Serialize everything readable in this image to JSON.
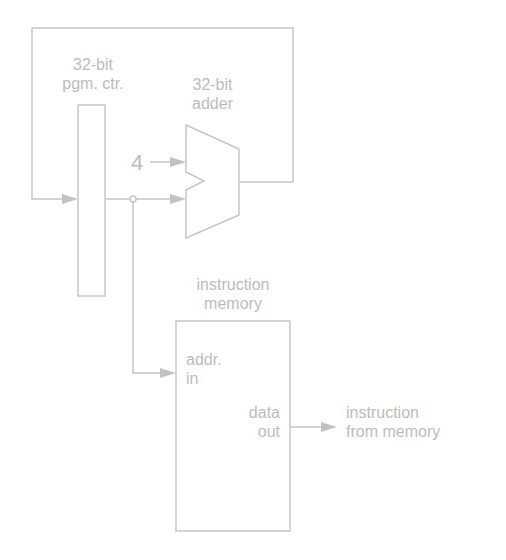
{
  "diagram": {
    "type": "datapath",
    "components": {
      "pc": {
        "label_line1": "32-bit",
        "label_line2": "pgm. ctr."
      },
      "adder": {
        "label_line1": "32-bit",
        "label_line2": "adder",
        "constant_input": "4"
      },
      "memory": {
        "label_line1": "instruction",
        "label_line2": "memory",
        "input_label_line1": "addr.",
        "input_label_line2": "in",
        "output_label_line1": "data",
        "output_label_line2": "out"
      }
    },
    "output": {
      "label_line1": "instruction",
      "label_line2": "from memory"
    },
    "colors": {
      "line": "#c6c6c6",
      "text": "#bcbcbc",
      "background": "#ffffff"
    }
  }
}
